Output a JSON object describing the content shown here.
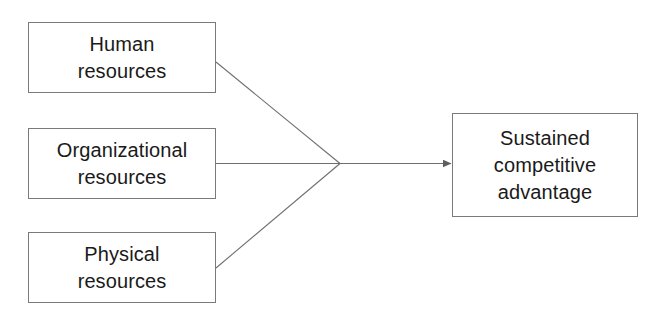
{
  "diagram": {
    "type": "flow-convergence",
    "background_color": "#ffffff",
    "line_color": "#6f6f6f",
    "border_color": "#7a7a7a",
    "text_color": "#1a1a1a",
    "inputs": [
      {
        "id": "human",
        "label": "Human\nresources"
      },
      {
        "id": "organizational",
        "label": "Organizational\nresources"
      },
      {
        "id": "physical",
        "label": "Physical\nresources"
      }
    ],
    "output": {
      "id": "outcome",
      "label": "Sustained\ncompetitive\nadvantage"
    },
    "connectors": [
      {
        "from": "human",
        "to": "junction",
        "style": "diagonal-down"
      },
      {
        "from": "organizational",
        "to": "junction",
        "style": "horizontal"
      },
      {
        "from": "physical",
        "to": "junction",
        "style": "diagonal-up"
      },
      {
        "from": "junction",
        "to": "outcome",
        "style": "arrow"
      }
    ]
  }
}
